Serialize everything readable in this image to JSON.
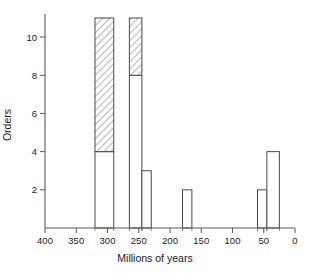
{
  "chart_data": {
    "type": "bar",
    "title": "",
    "subtitle": "",
    "xlabel": "Millions of years",
    "ylabel": "Orders",
    "xlim": [
      400,
      0
    ],
    "ylim": [
      0,
      11
    ],
    "x_axis_reversed": true,
    "grid": false,
    "legend": null,
    "x_tick_labels": [
      "400",
      "350",
      "300",
      "250",
      "200",
      "150",
      "100",
      "50",
      "0"
    ],
    "x_tick_values": [
      400,
      350,
      300,
      250,
      200,
      150,
      100,
      50,
      0
    ],
    "y_tick_labels": [
      "2",
      "4",
      "6",
      "8",
      "10"
    ],
    "y_tick_values": [
      2,
      4,
      6,
      8,
      10
    ],
    "bin_unit": "millions of years",
    "series": [
      {
        "name": "open",
        "style": "open-outline",
        "values": [
          4,
          8,
          3,
          2,
          2,
          4
        ]
      },
      {
        "name": "hatched",
        "style": "diagonal-hatch",
        "values": [
          7,
          3,
          0,
          0,
          0,
          0
        ]
      }
    ],
    "bars": [
      {
        "x_start": 320,
        "x_end": 290,
        "open": 4,
        "hatched": 7,
        "total": 11
      },
      {
        "x_start": 265,
        "x_end": 245,
        "open": 8,
        "hatched": 3,
        "total": 11
      },
      {
        "x_start": 245,
        "x_end": 230,
        "open": 3,
        "hatched": 0,
        "total": 3
      },
      {
        "x_start": 180,
        "x_end": 165,
        "open": 2,
        "hatched": 0,
        "total": 2
      },
      {
        "x_start": 60,
        "x_end": 45,
        "open": 2,
        "hatched": 0,
        "total": 2
      },
      {
        "x_start": 45,
        "x_end": 25,
        "open": 4,
        "hatched": 0,
        "total": 4
      }
    ]
  },
  "labels": {
    "x_axis_title": "Millions of years",
    "y_axis_title": "Orders"
  },
  "colors": {
    "background": "#ffffff",
    "axis": "#5a5a5a",
    "bar_outline": "#4a4a4a",
    "bar_fill": "#ffffff",
    "hatch": "#4a4a4a",
    "text": "#1a1a1a"
  }
}
